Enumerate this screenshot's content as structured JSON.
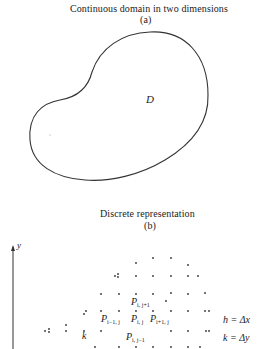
{
  "panel_a": {
    "title": "Continuous domain in two dimensions",
    "sublabel": "(a)",
    "region_label": "D"
  },
  "panel_b": {
    "title": "Discrete representation",
    "sublabel": "(b)",
    "axis_label": "y",
    "point_labels": {
      "top": {
        "base": "P",
        "sub": "i, j+1"
      },
      "left": {
        "base": "P",
        "sub": "i−1, j"
      },
      "center": {
        "base": "P",
        "sub": "i, j"
      },
      "right": {
        "base": "P",
        "sub": "i+1, j"
      },
      "bottom": {
        "base": "P",
        "sub": "i, j−1"
      }
    },
    "spacing_label": "k",
    "equations": [
      "h = Δx",
      "k = Δy"
    ]
  }
}
